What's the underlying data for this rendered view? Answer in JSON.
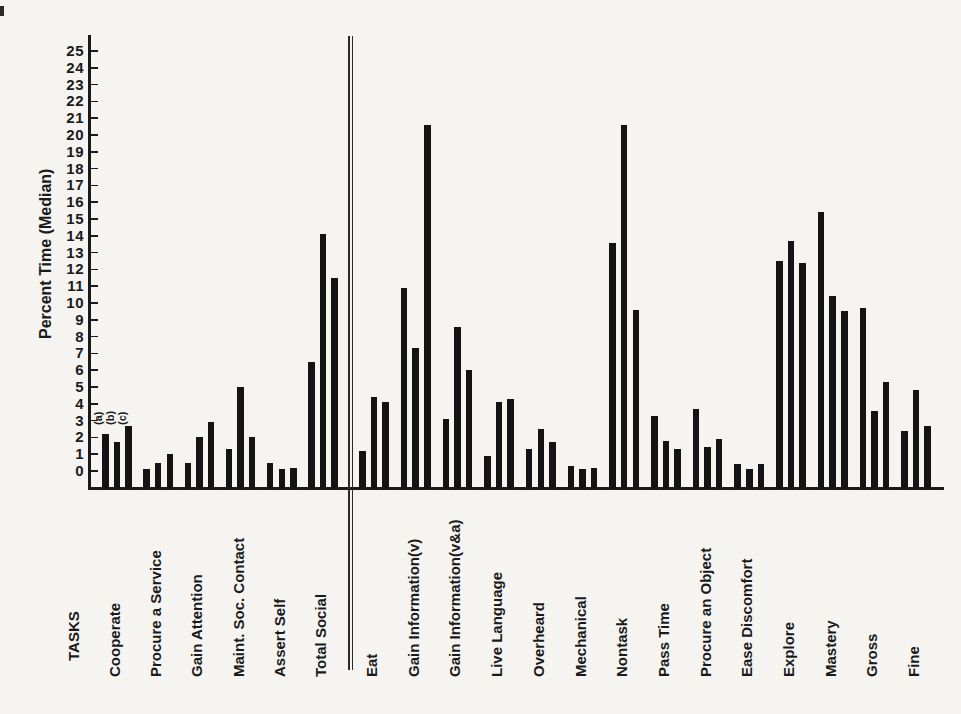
{
  "figure": {
    "ylabel": "Percent Time (Median)",
    "tasks_header": "TASKS"
  },
  "chart_data": {
    "type": "bar",
    "title": "",
    "xlabel": "TASKS",
    "ylabel": "Percent Time (Median)",
    "ylim": [
      0,
      25
    ],
    "ytick_step": 1,
    "grid": false,
    "legend_position": "none",
    "bar_labels": [
      "(a)",
      "(b)",
      "(c)"
    ],
    "bar_label_note": "the three bars of each task group are annotated (a), (b), (c) above the first group only",
    "separator_after": "Total Social",
    "separator_style": "double-vertical-line",
    "bar_color": "#141414",
    "groups": [
      {
        "label": "Cooperate",
        "values": [
          2.2,
          1.7,
          2.7
        ]
      },
      {
        "label": "Procure a Service",
        "values": [
          0.1,
          0.5,
          1.0
        ]
      },
      {
        "label": "Gain Attention",
        "values": [
          0.5,
          2.0,
          2.9
        ]
      },
      {
        "label": "Maint. Soc. Contact",
        "values": [
          1.3,
          5.0,
          2.0
        ]
      },
      {
        "label": "Assert Self",
        "values": [
          0.5,
          0.1,
          0.2
        ]
      },
      {
        "label": "Total Social",
        "values": [
          6.5,
          14.1,
          11.5
        ]
      },
      {
        "label": "Eat",
        "values": [
          1.2,
          4.4,
          4.1
        ]
      },
      {
        "label": "Gain Information(v)",
        "values": [
          10.9,
          7.3,
          20.6
        ]
      },
      {
        "label": "Gain Information(v&a)",
        "values": [
          3.1,
          8.6,
          6.0
        ]
      },
      {
        "label": "Live Language",
        "values": [
          0.9,
          4.1,
          4.3
        ]
      },
      {
        "label": "Overheard",
        "values": [
          1.3,
          2.5,
          1.7
        ]
      },
      {
        "label": "Mechanical",
        "values": [
          0.3,
          0.1,
          0.2
        ]
      },
      {
        "label": "Nontask",
        "values": [
          13.6,
          20.6,
          9.6
        ]
      },
      {
        "label": "Pass Time",
        "values": [
          3.3,
          1.8,
          1.3
        ]
      },
      {
        "label": "Procure an Object",
        "values": [
          3.7,
          1.4,
          1.9
        ]
      },
      {
        "label": "Ease Discomfort",
        "values": [
          0.4,
          0.1,
          0.4
        ]
      },
      {
        "label": "Explore",
        "values": [
          12.5,
          13.7,
          12.4
        ]
      },
      {
        "label": "Mastery",
        "values": [
          15.4,
          10.4,
          9.5
        ]
      },
      {
        "label": "Gross",
        "values": [
          9.7,
          3.6,
          5.3
        ]
      },
      {
        "label": "Fine",
        "values": [
          2.4,
          4.8,
          2.7
        ]
      }
    ]
  }
}
